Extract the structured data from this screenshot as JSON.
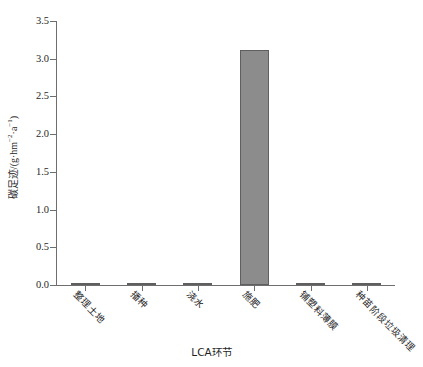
{
  "chart_data": {
    "type": "bar",
    "title": "",
    "xlabel": "LCA环节",
    "ylabel_cn": "碳足迹",
    "ylabel_unit": "/(g·hm⁻²·a⁻¹)",
    "ylabel_full": "碳足迹/(g·hm⁻²·a⁻¹)",
    "categories": [
      "整理土地",
      "播种",
      "浇水",
      "施肥",
      "铺塑料薄膜",
      "种苗阶段垃圾清理"
    ],
    "values": [
      0.005,
      0.005,
      0.03,
      3.11,
      0.03,
      0.01
    ],
    "ylim": [
      0,
      3.5
    ],
    "yticks": [
      0.0,
      0.5,
      1.0,
      1.5,
      2.0,
      2.5,
      3.0,
      3.5
    ],
    "ytick_labels": [
      "0.0",
      "0.5",
      "1.0",
      "1.5",
      "2.0",
      "2.5",
      "3.0",
      "3.5"
    ],
    "grid": false,
    "legend": false,
    "bar_color": "#8c8c8c",
    "bar_edge_color": "#5f5f5f",
    "axis_color": "#6e6e6e",
    "background": "#ffffff"
  }
}
